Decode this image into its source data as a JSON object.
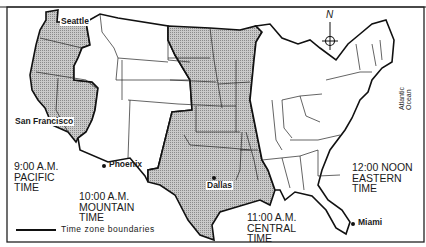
{
  "map": {
    "title_partial": "",
    "colors": {
      "shaded_zone": "#b8b8b8",
      "unshaded_zone": "#ffffff",
      "boundary": "#111111",
      "frame": "#222222"
    },
    "compass": {
      "label": "N"
    },
    "ocean_label": "Atlantic Ocean",
    "cities": [
      {
        "name": "Seattle"
      },
      {
        "name": "San Francisco"
      },
      {
        "name": "Phoenix"
      },
      {
        "name": "Dallas"
      },
      {
        "name": "Miami"
      }
    ],
    "time_zones": [
      {
        "time": "9:00 A.M.",
        "name": "PACIFIC",
        "suffix": "TIME",
        "shaded": true
      },
      {
        "time": "10:00 A.M.",
        "name": "MOUNTAIN",
        "suffix": "TIME",
        "shaded": false
      },
      {
        "time": "11:00 A.M.",
        "name": "CENTRAL",
        "suffix": "TIME",
        "shaded": true
      },
      {
        "time": "12:00 NOON",
        "name": "EASTERN",
        "suffix": "TIME",
        "shaded": false
      }
    ],
    "legend": {
      "label": "Time zone boundaries"
    }
  }
}
